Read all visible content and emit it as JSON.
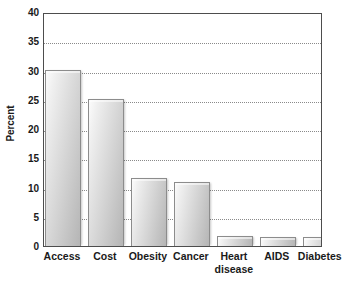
{
  "chart_data": {
    "type": "bar",
    "title": "",
    "subtitle": "",
    "xlabel": "",
    "ylabel": "Percent",
    "categories": [
      "Access",
      "Cost",
      "Obesity",
      "Cancer",
      "Heart\ndisease",
      "AIDS",
      "Diabetes"
    ],
    "values": [
      30.1,
      25.1,
      11.6,
      11.0,
      1.7,
      1.6,
      1.6
    ],
    "ylim": [
      0,
      40
    ],
    "ytick_labels": [
      "0",
      "5",
      "10",
      "15",
      "20",
      "25",
      "30",
      "35",
      "40"
    ],
    "ytick_values": [
      0,
      5,
      10,
      15,
      20,
      25,
      30,
      35,
      40
    ],
    "grid": true,
    "grid_axis": "y",
    "grid_style": "dotted",
    "legend": false,
    "legend_position": "none",
    "bar_fill_light": "#f2f2f2",
    "bar_fill_dark": "#b5b5b5",
    "bar_border_color": "#8c8c8c",
    "axis_color": "#4d4d4d",
    "grid_color": "#8a8a8a",
    "text_color": "#1a1a1a",
    "background_color": "#ffffff"
  }
}
